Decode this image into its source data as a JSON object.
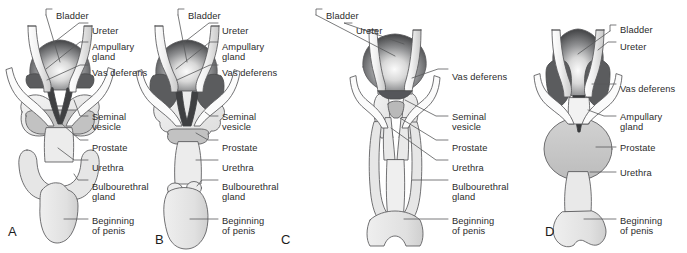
{
  "figure": {
    "background_color": "#ffffff",
    "text_color": "#2b2b2b",
    "outline_color": "#58595b",
    "fills": {
      "bladder_dark": "#4a4b4d",
      "bladder_light": "#f2f2f2",
      "ampullary_gland": "#5b5c5e",
      "seminal_vesicle": "#e8e8e8",
      "prostate": "#c9c9c9",
      "urethra": "#ececec",
      "penis": "#e3e3e3",
      "tube_white": "#fbfbfb"
    }
  },
  "panels": [
    {
      "id": "A",
      "letter": "A",
      "letter_x": 8,
      "letter_y": 224,
      "labels": [
        {
          "text": "Bladder",
          "x": 56,
          "y": 11,
          "anchor": "left"
        },
        {
          "text": "Ureter",
          "x": 92,
          "y": 26,
          "anchor": "left"
        },
        {
          "text": "Ampullary",
          "x": 92,
          "y": 42,
          "anchor": "left"
        },
        {
          "text": "gland",
          "x": 92,
          "y": 52,
          "anchor": "left"
        },
        {
          "text": "Vas deferens",
          "x": 92,
          "y": 68,
          "anchor": "left"
        },
        {
          "text": "Seminal",
          "x": 92,
          "y": 112,
          "anchor": "left"
        },
        {
          "text": "vesicle",
          "x": 92,
          "y": 122,
          "anchor": "left"
        },
        {
          "text": "Prostate",
          "x": 92,
          "y": 143,
          "anchor": "left"
        },
        {
          "text": "Urethra",
          "x": 92,
          "y": 163,
          "anchor": "left"
        },
        {
          "text": "Bulbourethral",
          "x": 92,
          "y": 182,
          "anchor": "left"
        },
        {
          "text": "gland",
          "x": 92,
          "y": 192,
          "anchor": "left"
        },
        {
          "text": "Beginning",
          "x": 92,
          "y": 216,
          "anchor": "left"
        },
        {
          "text": "of penis",
          "x": 92,
          "y": 226,
          "anchor": "left"
        }
      ]
    },
    {
      "id": "B",
      "letter": "B",
      "letter_x": 155,
      "letter_y": 232,
      "labels": [
        {
          "text": "Bladder",
          "x": 188,
          "y": 11,
          "anchor": "left"
        },
        {
          "text": "Ureter",
          "x": 222,
          "y": 26,
          "anchor": "left"
        },
        {
          "text": "Ampullary",
          "x": 222,
          "y": 42,
          "anchor": "left"
        },
        {
          "text": "gland",
          "x": 222,
          "y": 52,
          "anchor": "left"
        },
        {
          "text": "Vas deferens",
          "x": 222,
          "y": 68,
          "anchor": "left"
        },
        {
          "text": "Seminal",
          "x": 222,
          "y": 112,
          "anchor": "left"
        },
        {
          "text": "vesicle",
          "x": 222,
          "y": 122,
          "anchor": "left"
        },
        {
          "text": "Prostate",
          "x": 222,
          "y": 143,
          "anchor": "left"
        },
        {
          "text": "Urethra",
          "x": 222,
          "y": 163,
          "anchor": "left"
        },
        {
          "text": "Bulbourethral",
          "x": 222,
          "y": 182,
          "anchor": "left"
        },
        {
          "text": "gland",
          "x": 222,
          "y": 192,
          "anchor": "left"
        },
        {
          "text": "Beginning",
          "x": 222,
          "y": 216,
          "anchor": "left"
        },
        {
          "text": "of penis",
          "x": 222,
          "y": 226,
          "anchor": "left"
        }
      ]
    },
    {
      "id": "C",
      "letter": "C",
      "letter_x": 281,
      "letter_y": 232,
      "labels": [
        {
          "text": "Bladder",
          "x": 326,
          "y": 11,
          "anchor": "left"
        },
        {
          "text": "Ureter",
          "x": 356,
          "y": 26,
          "anchor": "left"
        },
        {
          "text": "Vas deferens",
          "x": 452,
          "y": 72,
          "anchor": "left"
        },
        {
          "text": "Seminal",
          "x": 452,
          "y": 112,
          "anchor": "left"
        },
        {
          "text": "vesicle",
          "x": 452,
          "y": 122,
          "anchor": "left"
        },
        {
          "text": "Prostate",
          "x": 452,
          "y": 143,
          "anchor": "left"
        },
        {
          "text": "Urethra",
          "x": 452,
          "y": 163,
          "anchor": "left"
        },
        {
          "text": "Bulbourethral",
          "x": 452,
          "y": 182,
          "anchor": "left"
        },
        {
          "text": "gland",
          "x": 452,
          "y": 192,
          "anchor": "left"
        },
        {
          "text": "Beginning",
          "x": 452,
          "y": 216,
          "anchor": "left"
        },
        {
          "text": "of penis",
          "x": 452,
          "y": 226,
          "anchor": "left"
        }
      ]
    },
    {
      "id": "D",
      "letter": "D",
      "letter_x": 545,
      "letter_y": 224,
      "labels": [
        {
          "text": "Bladder",
          "x": 620,
          "y": 27,
          "anchor": "left"
        },
        {
          "text": "Ureter",
          "x": 620,
          "y": 45,
          "anchor": "left"
        },
        {
          "text": "Vas deferens",
          "x": 620,
          "y": 87,
          "anchor": "left"
        },
        {
          "text": "Ampullary",
          "x": 620,
          "y": 119,
          "anchor": "left"
        },
        {
          "text": "gland",
          "x": 620,
          "y": 129,
          "anchor": "left"
        },
        {
          "text": "Prostate",
          "x": 620,
          "y": 150,
          "anchor": "left"
        },
        {
          "text": "Urethra",
          "x": 620,
          "y": 175,
          "anchor": "left"
        },
        {
          "text": "Beginning",
          "x": 620,
          "y": 216,
          "anchor": "left"
        },
        {
          "text": "of penis",
          "x": 620,
          "y": 226,
          "anchor": "left"
        }
      ]
    }
  ],
  "structure_names": [
    "bladder",
    "ureter",
    "ampullary-gland",
    "vas-deferens",
    "seminal-vesicle",
    "prostate",
    "urethra",
    "bulbourethral-gland",
    "beginning-of-penis"
  ]
}
